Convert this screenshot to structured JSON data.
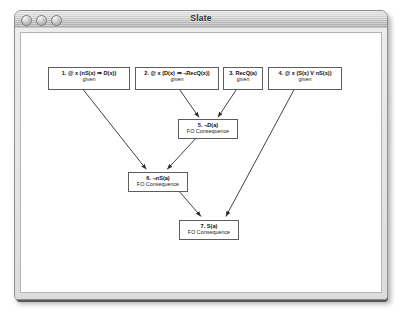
{
  "window": {
    "title": "Slate",
    "controls": [
      {
        "name": "close-button",
        "label": ""
      },
      {
        "name": "minimize-button",
        "label": ""
      },
      {
        "name": "zoom-button",
        "label": ""
      }
    ]
  },
  "graph": {
    "nodes": [
      {
        "id": "1",
        "formula": "1. @ x (nS(x) ⇒ D(x))",
        "justification": "given",
        "x": 46,
        "y": 65,
        "w": 82,
        "h": 23
      },
      {
        "id": "2",
        "formula": "2. @ x (D(x) ⇒ ¬RecQ(x))",
        "justification": "given",
        "x": 133,
        "y": 65,
        "w": 84,
        "h": 23
      },
      {
        "id": "3",
        "formula": "3. RecQ(a)",
        "justification": "given",
        "x": 221,
        "y": 65,
        "w": 40,
        "h": 23
      },
      {
        "id": "4",
        "formula": "4. @ x (S(x) V nS(x))",
        "justification": "given",
        "x": 266,
        "y": 65,
        "w": 74,
        "h": 23
      },
      {
        "id": "5",
        "formula": "5. ¬D(a)",
        "justification": "FO Consequence",
        "x": 176,
        "y": 117,
        "w": 60,
        "h": 20
      },
      {
        "id": "6",
        "formula": "6. ¬nS(a)",
        "justification": "FO Consequence",
        "x": 126,
        "y": 170,
        "w": 60,
        "h": 20
      },
      {
        "id": "7",
        "formula": "7. S(a)",
        "justification": "FO Consequence",
        "x": 177,
        "y": 218,
        "w": 60,
        "h": 20
      }
    ],
    "edges": [
      {
        "from": "1",
        "to": "6",
        "x1": 81,
        "y1": 88,
        "x2": 145,
        "y2": 170
      },
      {
        "from": "2",
        "to": "5",
        "x1": 178,
        "y1": 88,
        "x2": 198,
        "y2": 117
      },
      {
        "from": "3",
        "to": "5",
        "x1": 236,
        "y1": 88,
        "x2": 217,
        "y2": 117
      },
      {
        "from": "5",
        "to": "6",
        "x1": 196,
        "y1": 137,
        "x2": 166,
        "y2": 170
      },
      {
        "from": "6",
        "to": "7",
        "x1": 176,
        "y1": 190,
        "x2": 200,
        "y2": 218
      },
      {
        "from": "4",
        "to": "7",
        "x1": 294,
        "y1": 88,
        "x2": 225,
        "y2": 218
      }
    ],
    "edge_color": "#2a2a2a"
  }
}
